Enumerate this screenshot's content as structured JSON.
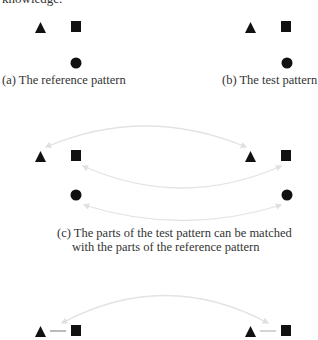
{
  "top_text": "knowledge.",
  "colors": {
    "shape": "#111111",
    "arc": "#e3e3e3",
    "link_left": "#777777",
    "link_right": "#aaaaaa"
  },
  "panels": {
    "a": {
      "caption": "(a) The reference pattern",
      "shapes": [
        "triangle",
        "square",
        "circle"
      ]
    },
    "b": {
      "caption": "(b) The test pattern",
      "shapes": [
        "triangle",
        "square",
        "circle"
      ]
    },
    "c": {
      "caption_line1": "(c) The parts of the test pattern can be matched",
      "caption_line2": "with the parts of the reference pattern",
      "matches": [
        {
          "from": "triangle",
          "to": "triangle"
        },
        {
          "from": "square",
          "to": "square"
        },
        {
          "from": "circle",
          "to": "circle"
        }
      ]
    },
    "d": {
      "shapes": [
        "triangle",
        "square"
      ],
      "relation": "triangle-square link",
      "matches": [
        {
          "from": "triangle-square link",
          "to": "triangle-square link"
        }
      ]
    }
  }
}
